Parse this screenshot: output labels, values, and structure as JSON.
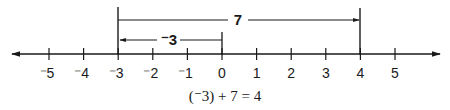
{
  "diagram": {
    "type": "number_line",
    "axis": {
      "min": -5,
      "max": 5,
      "ticks": [
        {
          "value": -5,
          "label": "⁻5"
        },
        {
          "value": -4,
          "label": "⁻4"
        },
        {
          "value": -3,
          "label": "⁻3"
        },
        {
          "value": -2,
          "label": "⁻2"
        },
        {
          "value": -1,
          "label": "⁻1"
        },
        {
          "value": 0,
          "label": "0"
        },
        {
          "value": 1,
          "label": "1"
        },
        {
          "value": 2,
          "label": "2"
        },
        {
          "value": 3,
          "label": "3"
        },
        {
          "value": 4,
          "label": "4"
        },
        {
          "value": 5,
          "label": "5"
        }
      ],
      "arrows": "both"
    },
    "spans": [
      {
        "from": -3,
        "to": 4,
        "label": "7",
        "direction": "right"
      },
      {
        "from": 0,
        "to": -3,
        "label": "⁻3",
        "direction": "left"
      }
    ],
    "equation": "(⁻3) + 7 = 4",
    "color": "#1a1a1a"
  }
}
